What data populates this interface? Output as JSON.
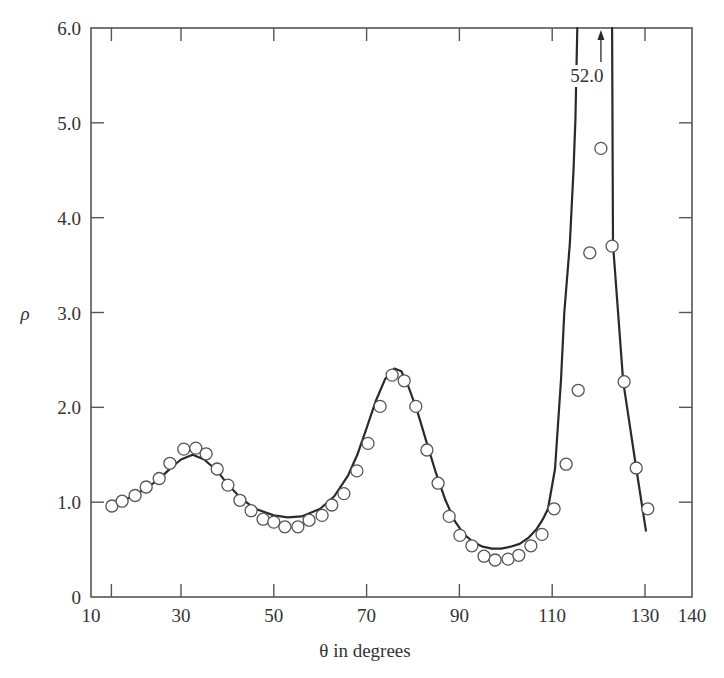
{
  "chart_data": {
    "type": "scatter",
    "title": "",
    "xlabel": "θ in degrees",
    "ylabel": "ρ",
    "xlim": [
      10,
      140
    ],
    "ylim": [
      0,
      6.0
    ],
    "grid": false,
    "legend": null,
    "frame": "box",
    "x_tick_labels": [
      "10",
      "30",
      "50",
      "70",
      "90",
      "110",
      "130",
      "140"
    ],
    "x_tick_label_values": [
      10,
      30,
      50,
      70,
      90,
      110,
      130,
      140
    ],
    "x_tick_marks": [
      15,
      30,
      50,
      70,
      90,
      110,
      130
    ],
    "y_tick_labels": [
      "0",
      "1.0",
      "2.0",
      "3.0",
      "4.0",
      "5.0",
      "6.0"
    ],
    "y_tick_values": [
      0,
      1,
      2,
      3,
      4,
      5,
      6
    ],
    "annotations": [
      {
        "text": "52.0",
        "x": 120.5,
        "y": 6.0,
        "arrow": "up",
        "meaning": "curve peak value off-scale"
      }
    ],
    "series": [
      {
        "name": "Experimental data",
        "type": "scatter",
        "marker": "open-circle",
        "x": [
          15.1,
          17.3,
          20.1,
          22.5,
          25.3,
          27.6,
          30.6,
          33.2,
          35.4,
          37.8,
          40.1,
          42.7,
          45.1,
          47.7,
          50.0,
          52.4,
          55.2,
          57.6,
          60.4,
          62.5,
          65.1,
          67.9,
          70.3,
          72.9,
          75.5,
          78.1,
          80.6,
          83.0,
          85.4,
          87.8,
          90.1,
          92.7,
          95.3,
          97.7,
          100.5,
          102.8,
          105.4,
          107.8,
          110.4,
          113.0,
          115.6,
          118.1,
          120.5,
          122.9,
          125.5,
          128.1,
          130.6
        ],
        "y": [
          0.96,
          1.01,
          1.07,
          1.16,
          1.25,
          1.41,
          1.56,
          1.57,
          1.51,
          1.35,
          1.18,
          1.02,
          0.91,
          0.82,
          0.79,
          0.74,
          0.74,
          0.81,
          0.86,
          0.97,
          1.09,
          1.33,
          1.62,
          2.01,
          2.34,
          2.28,
          2.01,
          1.55,
          1.2,
          0.85,
          0.65,
          0.54,
          0.43,
          0.39,
          0.4,
          0.44,
          0.54,
          0.66,
          0.93,
          1.4,
          2.18,
          3.63,
          4.73,
          3.7,
          2.27,
          1.36,
          0.93
        ]
      },
      {
        "name": "Theory",
        "type": "line",
        "segments": [
          {
            "x": [
              15.1,
              20,
              25,
              28,
              30,
              32.5,
              35,
              38,
              40,
              43,
              46,
              50,
              53,
              56,
              60,
              63,
              66,
              68,
              70,
              72,
              74,
              76,
              77.5,
              79,
              81,
              83,
              85,
              87,
              89,
              91,
              93,
              95,
              97,
              99,
              101,
              103,
              105,
              106.7,
              108,
              109.1,
              110.6,
              111.9,
              112.6,
              113.8,
              114.6,
              115.0,
              115.4
            ],
            "y": [
              0.97,
              1.07,
              1.23,
              1.37,
              1.45,
              1.5,
              1.45,
              1.32,
              1.19,
              1.04,
              0.93,
              0.86,
              0.84,
              0.85,
              0.93,
              1.06,
              1.28,
              1.5,
              1.78,
              2.07,
              2.3,
              2.41,
              2.38,
              2.22,
              1.95,
              1.62,
              1.3,
              1.02,
              0.8,
              0.66,
              0.58,
              0.53,
              0.51,
              0.51,
              0.53,
              0.56,
              0.63,
              0.72,
              0.82,
              0.93,
              1.35,
              2.29,
              3.0,
              3.72,
              4.5,
              5.03,
              6.0
            ]
          },
          {
            "x": [
              122.9,
              123.1,
              125.3,
              128.1,
              130.2
            ],
            "y": [
              6.0,
              3.72,
              2.27,
              1.36,
              0.7
            ]
          }
        ],
        "peak_value_offscale": 52.0
      }
    ]
  },
  "style": {
    "ink_color": "#2a2a2a",
    "axis_color": "#555555",
    "marker_stroke": "#555555",
    "background": "#ffffff"
  }
}
